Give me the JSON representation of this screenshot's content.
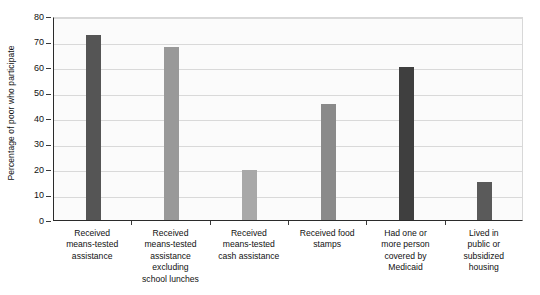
{
  "chart_data": {
    "type": "bar",
    "title": "",
    "xlabel": "",
    "ylabel": "Percentage of poor who participate",
    "ylim": [
      0,
      80
    ],
    "ytick_step": 10,
    "yticks": [
      "0",
      "10",
      "20",
      "30",
      "40",
      "50",
      "60",
      "70",
      "80"
    ],
    "grid": true,
    "legend": "none",
    "categories": [
      "Received means-tested assistance",
      "Received means-tested assistance excluding school lunches",
      "Received means-tested cash assistance",
      "Received food stamps",
      "Had one or more person covered by Medicaid",
      "Lived in public or subsidized housing"
    ],
    "category_label_lines": [
      [
        "Received",
        "means-tested",
        "assistance"
      ],
      [
        "Received",
        "means-tested",
        "assistance",
        "excluding",
        "school lunches"
      ],
      [
        "Received",
        "means-tested",
        "cash assistance"
      ],
      [
        "Received food",
        "stamps"
      ],
      [
        "Had one or",
        "more person",
        "covered by",
        "Medicaid"
      ],
      [
        "Lived in",
        "public or",
        "subsidized",
        "housing"
      ]
    ],
    "values": [
      72.5,
      68,
      19.5,
      45.5,
      60,
      14.8
    ],
    "bar_colors": [
      "#555555",
      "#999999",
      "#a8a8a8",
      "#8a8a8a",
      "#3f3f3f",
      "#5a5a5a"
    ],
    "colors": {
      "plot_background": "#fbfbfb",
      "gridline": "#d9d9d9",
      "axis": "#2b2b2b",
      "text": "#111111"
    }
  }
}
